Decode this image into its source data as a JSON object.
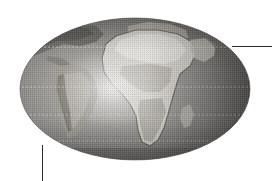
{
  "figure": {
    "title": "World map globe",
    "caption": "Grayscale halftone elliptical world map centered on Africa",
    "background_color": "#ffffff",
    "width": 272,
    "height": 181
  },
  "globe": {
    "name": "world-globe",
    "projection": "elliptical",
    "center_longitude": 20,
    "center_latitude": 0,
    "bounds": {
      "left": 20,
      "top": 18,
      "right": 250,
      "bottom": 160
    },
    "center": {
      "x": 135,
      "y": 89
    },
    "radius": {
      "x": 115,
      "y": 71
    },
    "shading": "light-center-dark-limb",
    "colors": {
      "ocean_light": "#b9b9b9",
      "ocean_mid": "#8e8e8e",
      "ocean_dark": "#565656",
      "land_light": "#e4e2dc",
      "land_mid": "#c2bfb6",
      "land_dark": "#77746c",
      "outline": "#4a4a4a",
      "highlight": "#f2f1ee"
    }
  },
  "gridlines": {
    "name": "latitude-gridlines",
    "style": "dotted",
    "color": "#d9d9d9",
    "latitudes": [
      {
        "label": "Tropic of Cancer",
        "y": 47
      },
      {
        "label": "Equator",
        "y": 87
      },
      {
        "label": "Tropic of Capricorn",
        "y": 115
      },
      {
        "label": "Southern parallel",
        "y": 141
      }
    ]
  },
  "landmasses": [
    {
      "name": "africa",
      "tone": "light"
    },
    {
      "name": "south-america",
      "tone": "mid"
    },
    {
      "name": "europe",
      "tone": "mid"
    },
    {
      "name": "middle-east",
      "tone": "mid"
    },
    {
      "name": "madagascar",
      "tone": "mid"
    },
    {
      "name": "north-america",
      "tone": "dark"
    }
  ],
  "leaders": [
    {
      "name": "leader-line-right",
      "orientation": "horizontal",
      "color": "#2b2b2b",
      "x1": 232,
      "y1": 46,
      "x2": 272,
      "y2": 46
    },
    {
      "name": "leader-line-bottom",
      "orientation": "vertical",
      "color": "#2b2b2b",
      "x1": 42,
      "y1": 145,
      "x2": 42,
      "y2": 181
    }
  ]
}
